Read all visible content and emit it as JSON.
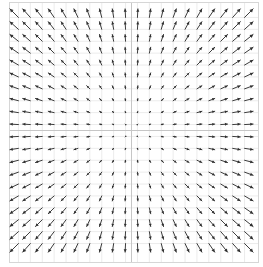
{
  "figure": {
    "kind": "quiver-plot",
    "background": "#ffffff"
  },
  "chart_data": {
    "type": "quiver",
    "title": "",
    "xlabel": "",
    "ylabel": "",
    "field": {
      "u_formula": "u = x",
      "v_formula": "v = y"
    },
    "grid": {
      "n_x": 20,
      "n_y": 20,
      "x_range": [
        -1,
        1
      ],
      "y_range": [
        -1,
        1
      ]
    },
    "layout_hints": {
      "grid_visible": true,
      "tick_labels_visible": false,
      "legend_visible": false,
      "frame_visible": true,
      "axis_lines_through_origin": true,
      "arrow_pivot": "tail"
    },
    "style": {
      "arrow_color": "#3d3d3d",
      "arrow_head_color": "#2f2f2f",
      "grid_color": "#ececec",
      "axis_line_color": "#c6c6c6",
      "frame_color": "#d6d6d6",
      "background": "#ffffff"
    }
  }
}
